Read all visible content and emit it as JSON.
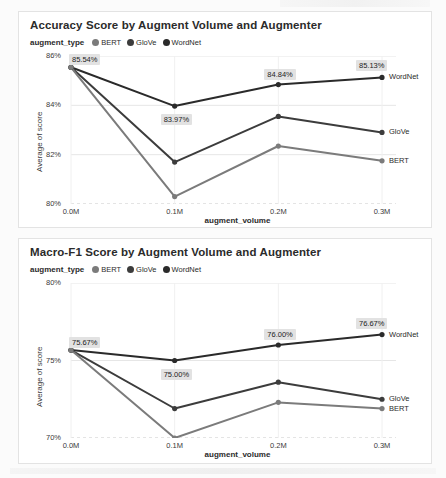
{
  "colors": {
    "bert": "#7b7b7b",
    "glove": "#3c3c3c",
    "wordnet": "#2a2a2a",
    "grid": "#e6e6e6",
    "label_bg": "#e2e2e2",
    "card_border": "#e3e3e3"
  },
  "legend": {
    "title": "augment_type",
    "items": [
      {
        "label": "BERT",
        "color": "#7b7b7b",
        "dot": "legend-dot-bert"
      },
      {
        "label": "GloVe",
        "color": "#3c3c3c",
        "dot": "legend-dot-glove"
      },
      {
        "label": "WordNet",
        "color": "#2a2a2a",
        "dot": "legend-dot-wordnet"
      }
    ]
  },
  "chart_data": [
    {
      "id": "accuracy",
      "type": "line",
      "title": "Accuracy Score by Augment Volume and Augmenter",
      "xlabel": "augment_volume",
      "ylabel": "Average of score",
      "categories": [
        "0.0M",
        "0.1M",
        "0.2M",
        "0.3M"
      ],
      "x": [
        0.0,
        0.1,
        0.2,
        0.3
      ],
      "ylim": [
        80,
        86
      ],
      "yticks": [
        80,
        82,
        84,
        86
      ],
      "ytick_labels": [
        "80%",
        "82%",
        "84%",
        "86%"
      ],
      "grid": true,
      "legend_position": "top-left",
      "series": [
        {
          "name": "WordNet",
          "color": "#2a2a2a",
          "values": [
            85.54,
            83.97,
            84.84,
            85.13
          ]
        },
        {
          "name": "GloVe",
          "color": "#3c3c3c",
          "values": [
            85.54,
            81.7,
            83.55,
            82.9
          ]
        },
        {
          "name": "BERT",
          "color": "#7b7b7b",
          "values": [
            85.54,
            80.3,
            82.35,
            81.75
          ]
        }
      ],
      "annotations": [
        {
          "text": "85.54%",
          "series": "WordNet",
          "index": 0
        },
        {
          "text": "83.97%",
          "series": "WordNet",
          "index": 1
        },
        {
          "text": "84.84%",
          "series": "WordNet",
          "index": 2
        },
        {
          "text": "85.13%",
          "series": "WordNet",
          "index": 3
        }
      ]
    },
    {
      "id": "macrof1",
      "type": "line",
      "title": "Macro-F1 Score by Augment Volume and Augmenter",
      "xlabel": "augment_volume",
      "ylabel": "Average of score",
      "categories": [
        "0.0M",
        "0.1M",
        "0.2M",
        "0.3M"
      ],
      "x": [
        0.0,
        0.1,
        0.2,
        0.3
      ],
      "ylim": [
        70,
        80
      ],
      "yticks": [
        70,
        75,
        80
      ],
      "ytick_labels": [
        "70%",
        "75%",
        "80%"
      ],
      "grid": true,
      "legend_position": "top-left",
      "series": [
        {
          "name": "WordNet",
          "color": "#2a2a2a",
          "values": [
            75.67,
            75.0,
            76.0,
            76.67
          ]
        },
        {
          "name": "GloVe",
          "color": "#3c3c3c",
          "values": [
            75.67,
            71.9,
            73.6,
            72.5
          ]
        },
        {
          "name": "BERT",
          "color": "#7b7b7b",
          "values": [
            75.67,
            70.0,
            72.3,
            71.9
          ]
        }
      ],
      "annotations": [
        {
          "text": "75.67%",
          "series": "WordNet",
          "index": 0
        },
        {
          "text": "75.00%",
          "series": "WordNet",
          "index": 1
        },
        {
          "text": "76.00%",
          "series": "WordNet",
          "index": 2
        },
        {
          "text": "76.67%",
          "series": "WordNet",
          "index": 3
        }
      ]
    }
  ]
}
